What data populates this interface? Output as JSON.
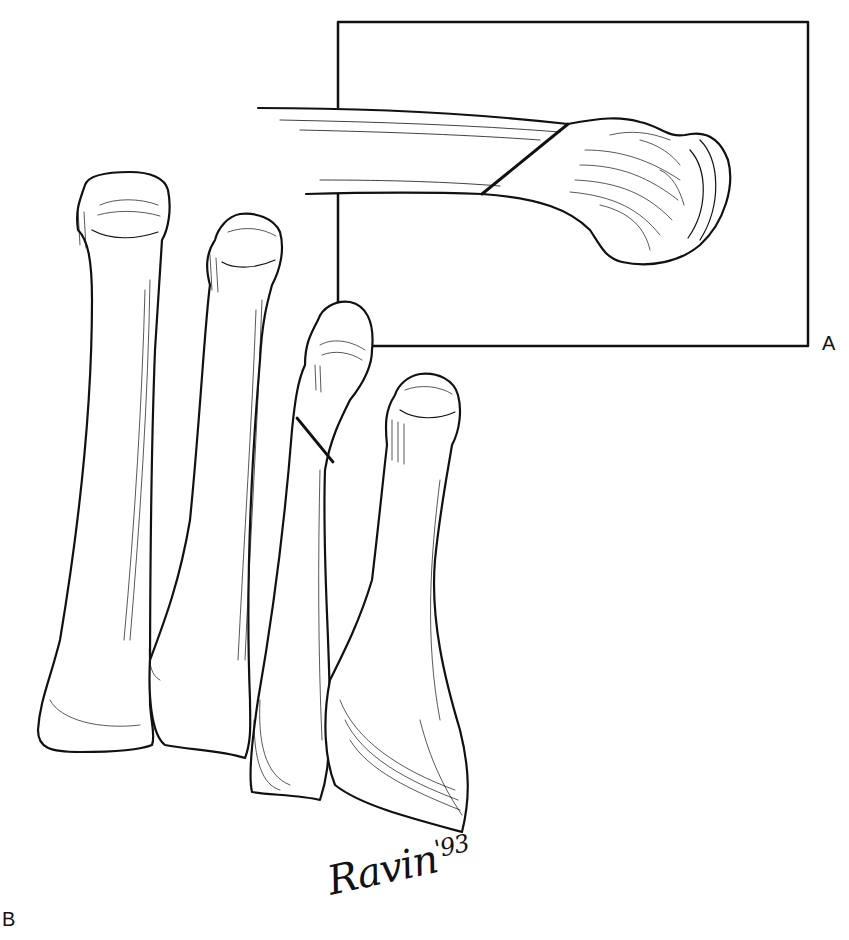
{
  "figure": {
    "type": "anatomical line illustration",
    "panels": [
      {
        "id": "A",
        "label": "A",
        "description": "Inset box: single metatarsal shown in lateral view with an oblique osteotomy line across the distal shaft"
      },
      {
        "id": "B",
        "label": "B",
        "description": "Four lesser metatarsals in dorsal view; the third bone shows an oblique osteotomy line near the neck"
      }
    ],
    "signature": {
      "name": "Ravin",
      "year": "'93"
    },
    "colors": {
      "ink": "#111111",
      "paper": "#ffffff"
    }
  }
}
